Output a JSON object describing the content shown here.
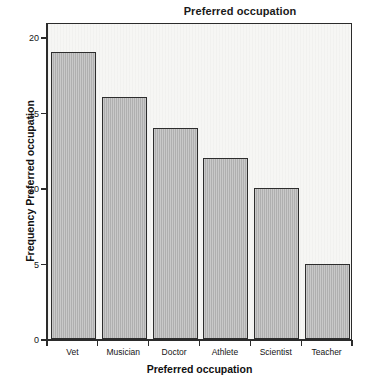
{
  "chart_data": {
    "type": "bar",
    "title": "Preferred occupation",
    "xlabel": "Preferred occupation",
    "ylabel": "Frequency Preferred occupation",
    "categories": [
      "Vet",
      "Musician",
      "Doctor",
      "Athlete",
      "Scientist",
      "Teacher"
    ],
    "values": [
      19,
      16,
      14,
      12,
      10,
      5
    ],
    "ylim": [
      0,
      21
    ],
    "yticks": [
      0,
      5,
      10,
      15,
      20
    ],
    "ytick_labels": [
      "0",
      "5",
      "10",
      "15",
      "20"
    ],
    "grid": false,
    "legend": null,
    "colors": {
      "bar_fill": "#b2b2b2",
      "bar_edge": "#2d2d2d",
      "panel_background": "#f6f6f4",
      "axis": "#2b2b2b",
      "text": "#141414",
      "figure_background": "#ffffff"
    }
  }
}
